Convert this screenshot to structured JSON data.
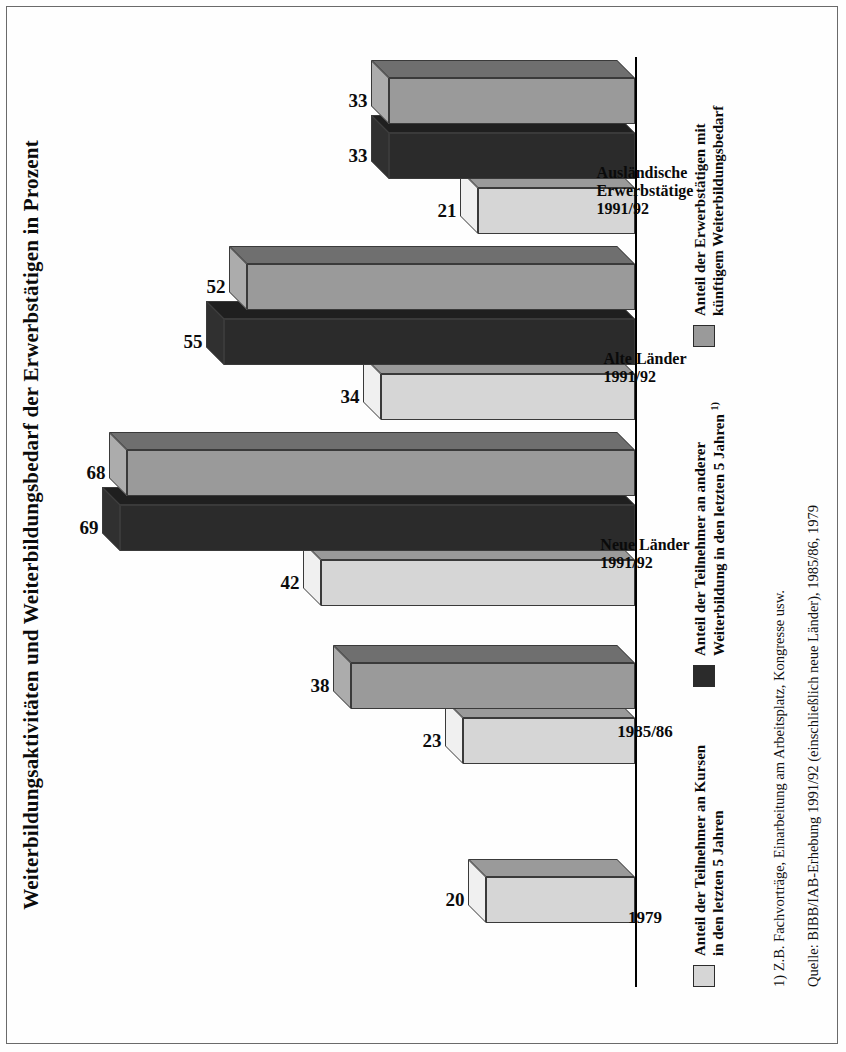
{
  "title": "Weiterbildungsaktivitäten und Weiterbildungsbedarf der Erwerbstätigen in Prozent",
  "legend": {
    "items": [
      {
        "label": "Anteil der Teilnehmer an Kursen\nin den letzten 5 Jahren",
        "color": "#d6d6d6",
        "swatch_name": "legend-swatch-kurse"
      },
      {
        "label": "Anteil der Teilnehmer an anderer\nWeiterbildung in den letzten 5 Jahren",
        "label_sup": "1)",
        "color": "#2b2b2b",
        "swatch_name": "legend-swatch-andere"
      },
      {
        "label": "Anteil der Erwerbstätigen mit\nkünftigem Weiterbildungsbedarf",
        "color": "#9a9a9a",
        "swatch_name": "legend-swatch-bedarf"
      }
    ]
  },
  "footnote": "1) Z.B. Fachvorträge, Einarbeitung am Arbeitsplatz, Kongresse usw.",
  "source": "Quelle: BIBB/IAB-Erhebung 1991/92 (einschließlich neue Länder), 1985/86, 1979",
  "chart_data": {
    "type": "bar",
    "orientation": "horizontal-3d",
    "title": "Weiterbildungsaktivitäten und Weiterbildungsbedarf der Erwerbstätigen in Prozent",
    "xlabel": "",
    "ylabel": "Prozent",
    "ylim": [
      0,
      75
    ],
    "grid": false,
    "legend_position": "bottom-left",
    "categories": [
      "1979",
      "1985/86",
      "Neue Länder\n1991/92",
      "Alte Länder\n1991/92",
      "Ausländische\nErwerbstätige\n1991/92"
    ],
    "series": [
      {
        "name": "Anteil der Teilnehmer an Kursen in den letzten 5 Jahren",
        "color": "#d6d6d6",
        "values": [
          20,
          23,
          42,
          34,
          21
        ]
      },
      {
        "name": "Anteil der Teilnehmer an anderer Weiterbildung in den letzten 5 Jahren",
        "color": "#2b2b2b",
        "values": [
          null,
          null,
          69,
          55,
          33
        ]
      },
      {
        "name": "Anteil der Erwerbstätigen mit künftigem Weiterbildungsbedarf",
        "color": "#9a9a9a",
        "values": [
          null,
          38,
          68,
          52,
          33
        ]
      }
    ],
    "data_labels": [
      "20",
      "23",
      "38",
      "42",
      "69",
      "68",
      "34",
      "55",
      "52",
      "21",
      "33",
      "33"
    ]
  },
  "bars": [
    {
      "group": "1979",
      "series": 0,
      "value": 20,
      "label": "20",
      "color": "#d6d6d6",
      "name": "bar-1979-kurse"
    },
    {
      "group": "1985/86",
      "series": 0,
      "value": 23,
      "label": "23",
      "color": "#d6d6d6",
      "name": "bar-1985-kurse"
    },
    {
      "group": "1985/86",
      "series": 2,
      "value": 38,
      "label": "38",
      "color": "#9a9a9a",
      "name": "bar-1985-bedarf"
    },
    {
      "group": "Neue Länder 1991/92",
      "series": 0,
      "value": 42,
      "label": "42",
      "color": "#d6d6d6",
      "name": "bar-neue-kurse"
    },
    {
      "group": "Neue Länder 1991/92",
      "series": 1,
      "value": 69,
      "label": "69",
      "color": "#2b2b2b",
      "name": "bar-neue-andere"
    },
    {
      "group": "Neue Länder 1991/92",
      "series": 2,
      "value": 68,
      "label": "68",
      "color": "#9a9a9a",
      "name": "bar-neue-bedarf"
    },
    {
      "group": "Alte Länder 1991/92",
      "series": 0,
      "value": 34,
      "label": "34",
      "color": "#d6d6d6",
      "name": "bar-alte-kurse"
    },
    {
      "group": "Alte Länder 1991/92",
      "series": 1,
      "value": 55,
      "label": "55",
      "color": "#2b2b2b",
      "name": "bar-alte-andere"
    },
    {
      "group": "Alte Länder 1991/92",
      "series": 2,
      "value": 52,
      "label": "52",
      "color": "#9a9a9a",
      "name": "bar-alte-bedarf"
    },
    {
      "group": "Ausländische Erwerbstätige 1991/92",
      "series": 0,
      "value": 21,
      "label": "21",
      "color": "#d6d6d6",
      "name": "bar-auslaend-kurse"
    },
    {
      "group": "Ausländische Erwerbstätige 1991/92",
      "series": 1,
      "value": 33,
      "label": "33",
      "color": "#2b2b2b",
      "name": "bar-auslaend-andere"
    },
    {
      "group": "Ausländische Erwerbstätige 1991/92",
      "series": 2,
      "value": 33,
      "label": "33",
      "color": "#9a9a9a",
      "name": "bar-auslaend-bedarf"
    }
  ],
  "category_labels": [
    {
      "text": "1979",
      "name": "cat-label-1979"
    },
    {
      "text": "1985/86",
      "name": "cat-label-1985-86"
    },
    {
      "text": "Neue Länder\n1991/92",
      "name": "cat-label-neue-laender"
    },
    {
      "text": "Alte Länder\n1991/92",
      "name": "cat-label-alte-laender"
    },
    {
      "text": "Ausländische\nErwerbstätige\n1991/92",
      "name": "cat-label-auslaendische"
    }
  ]
}
